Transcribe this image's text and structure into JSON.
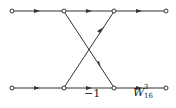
{
  "diagram": {
    "type": "signal-flow butterfly",
    "nodes": [
      {
        "id": "n0",
        "x": 12,
        "y": 11
      },
      {
        "id": "n1",
        "x": 64,
        "y": 11
      },
      {
        "id": "n2",
        "x": 114,
        "y": 11
      },
      {
        "id": "n3",
        "x": 166,
        "y": 11
      },
      {
        "id": "n4",
        "x": 12,
        "y": 88
      },
      {
        "id": "n5",
        "x": 64,
        "y": 88
      },
      {
        "id": "n6",
        "x": 114,
        "y": 88
      },
      {
        "id": "n7",
        "x": 166,
        "y": 88
      }
    ],
    "edges": [
      {
        "from": "n0",
        "to": "n1"
      },
      {
        "from": "n1",
        "to": "n2"
      },
      {
        "from": "n2",
        "to": "n3"
      },
      {
        "from": "n4",
        "to": "n5"
      },
      {
        "from": "n5",
        "to": "n6",
        "label": "-1"
      },
      {
        "from": "n6",
        "to": "n7",
        "label": "W_16^3"
      },
      {
        "from": "n1",
        "to": "n6"
      },
      {
        "from": "n5",
        "to": "n2"
      }
    ],
    "labels": {
      "minus_one": "−1",
      "twiddle_base": "W",
      "twiddle_sup": "3",
      "twiddle_sub": "16"
    },
    "colors": {
      "line": "#333333",
      "node_fill": "#ffffff"
    }
  }
}
